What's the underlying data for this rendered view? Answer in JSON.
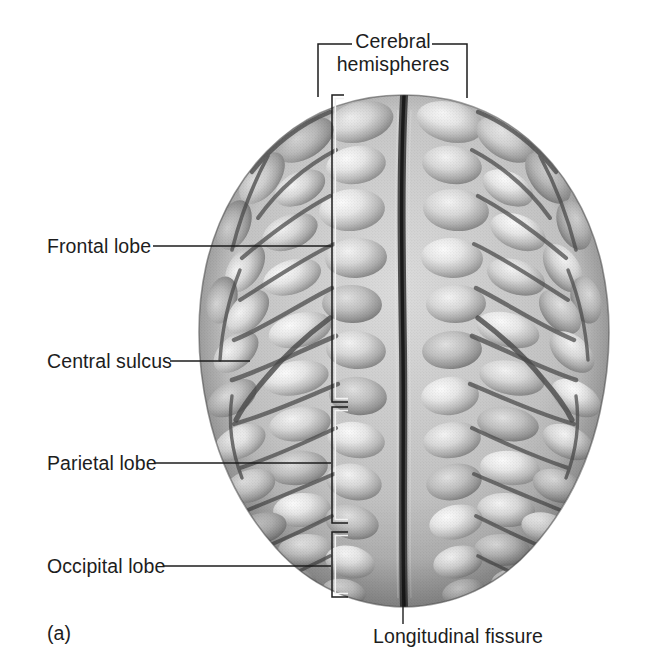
{
  "figure": {
    "panel_label": "(a)",
    "view": "superior view of the human brain",
    "background_color": "#ffffff",
    "text_color": "#1d1d1d"
  },
  "labels": {
    "cerebral_hemispheres_line1": "Cerebral",
    "cerebral_hemispheres_line2": "hemispheres",
    "frontal_lobe": "Frontal lobe",
    "central_sulcus": "Central sulcus",
    "parietal_lobe": "Parietal lobe",
    "occipital_lobe": "Occipital lobe",
    "longitudinal_fissure": "Longitudinal fissure"
  },
  "brackets": {
    "cerebral": {
      "x_left": 318,
      "x_right": 467,
      "y_top": 44,
      "y_bottom": 97
    },
    "frontal": {
      "x": 332,
      "y_top": 95,
      "y_bottom": 402
    },
    "parietal": {
      "x": 332,
      "y_top": 407,
      "y_bottom": 523
    },
    "occipital": {
      "x": 332,
      "y_top": 532,
      "y_bottom": 597
    }
  },
  "leaders": {
    "frontal_lobe": {
      "x_start": 153,
      "x_end": 331,
      "y": 246
    },
    "central_sulcus": {
      "x_start": 170,
      "x_end": 250,
      "y": 361
    },
    "parietal_lobe": {
      "x_start": 155,
      "x_end": 331,
      "y": 463
    },
    "occipital_lobe": {
      "x_start": 163,
      "x_end": 331,
      "y": 566
    },
    "longitudinal_fissure": {
      "x": 403,
      "y_start": 600,
      "y_end": 625
    }
  },
  "brain": {
    "bounds": {
      "x": 200,
      "y": 95,
      "width": 410,
      "height": 513
    },
    "midline_x": 404,
    "fill_colors": {
      "gyrus_light": "#e8e8e8",
      "gyrus_mid": "#b4b4b4",
      "sulcus_dark": "#5a5a5a",
      "edge_shadow": "#6e6e6e",
      "outline": "#3c3c3c"
    }
  }
}
